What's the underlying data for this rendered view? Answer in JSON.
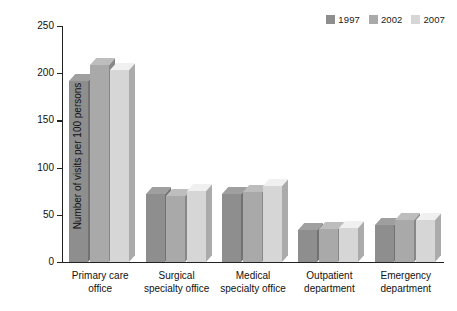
{
  "chart_data": {
    "type": "bar",
    "title": "",
    "xlabel": "",
    "ylabel": "Number of visits per 100 persons",
    "ylim": [
      0,
      250
    ],
    "yticks": [
      0,
      50,
      100,
      150,
      200,
      250
    ],
    "grid": false,
    "legend_position": "top-right",
    "categories": [
      "Primary care\noffice",
      "Surgical\nspecialty office",
      "Medical\nspecialty office",
      "Outpatient\ndepartment",
      "Emergency\ndepartment"
    ],
    "series": [
      {
        "name": "1997",
        "color": "#8e8e8e",
        "values": [
          192,
          72,
          72,
          34,
          39
        ]
      },
      {
        "name": "2002",
        "color": "#a9a9a9",
        "values": [
          209,
          70,
          74,
          35,
          44
        ]
      },
      {
        "name": "2007",
        "color": "#d6d6d6",
        "values": [
          203,
          75,
          80,
          36,
          45
        ]
      }
    ]
  },
  "axis": {
    "y_title": "Number of visits per 100 persons",
    "y_tick_labels": [
      "0",
      "50",
      "100",
      "150",
      "200",
      "250"
    ]
  },
  "legend": {
    "entries": [
      {
        "label": "1997",
        "color": "#8e8e8e"
      },
      {
        "label": "2002",
        "color": "#a9a9a9"
      },
      {
        "label": "2007",
        "color": "#d6d6d6"
      }
    ]
  }
}
